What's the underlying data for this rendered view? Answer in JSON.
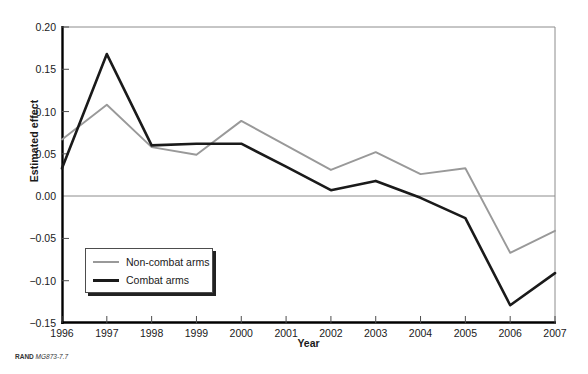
{
  "chart_data": {
    "type": "line",
    "title": "",
    "xlabel": "Year",
    "ylabel": "Estimated effect",
    "x": [
      1996,
      1997,
      1998,
      1999,
      2000,
      2001,
      2002,
      2003,
      2004,
      2005,
      2006,
      2007
    ],
    "xtick_labels": [
      "1996",
      "1997",
      "1998",
      "1999",
      "2000",
      "2001",
      "2002",
      "2003",
      "2004",
      "2005",
      "2006",
      "2007"
    ],
    "xlim": [
      1996,
      2007
    ],
    "ylim": [
      -0.15,
      0.2
    ],
    "ytick_labels": [
      "0.20",
      "0.15",
      "0.10",
      "0.05",
      "0.00",
      "-0.05",
      "-0.10",
      "-0.15"
    ],
    "ytick_values": [
      0.2,
      0.15,
      0.1,
      0.05,
      0.0,
      -0.05,
      -0.1,
      -0.15
    ],
    "grid": "zero-line and top-frame only",
    "legend_position": "lower-left inside axes",
    "series": [
      {
        "name": "Non-combat arms",
        "color": "#999999",
        "values": [
          0.067,
          0.108,
          0.058,
          0.049,
          0.089,
          0.06,
          0.031,
          0.052,
          0.026,
          0.033,
          -0.067,
          -0.041
        ]
      },
      {
        "name": "Combat arms",
        "color": "#1a1a1a",
        "values": [
          0.033,
          0.168,
          0.06,
          0.062,
          0.062,
          0.035,
          0.007,
          0.018,
          -0.002,
          -0.026,
          -0.129,
          -0.091
        ]
      }
    ]
  },
  "legend": {
    "items": [
      {
        "label": "Non-combat arms"
      },
      {
        "label": "Combat arms"
      }
    ]
  },
  "credit": {
    "brand": "RAND",
    "code": "MG873-7.7"
  },
  "colors": {
    "non_combat": "#999999",
    "combat": "#1a1a1a",
    "frame": "#8c8c8c",
    "axis": "#000000"
  }
}
